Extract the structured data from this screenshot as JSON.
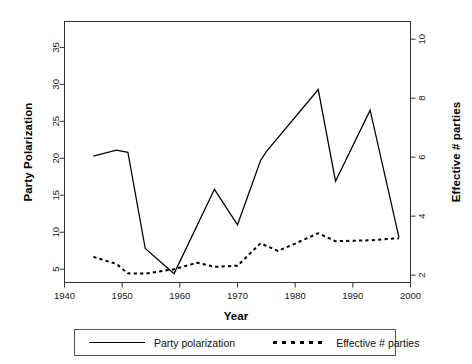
{
  "chart_data": {
    "type": "line",
    "title": "",
    "xlabel": "Year",
    "ylabel": "Party Polarization",
    "y2label": "Effective # parties",
    "xlim": [
      1940,
      2000
    ],
    "ylim": [
      3.2,
      38.5
    ],
    "y2lim": [
      1.75,
      10.6
    ],
    "grid": false,
    "legend_position": "bottom",
    "xticks": [
      1940,
      1950,
      1960,
      1970,
      1980,
      1990,
      2000
    ],
    "yticks": [
      5,
      10,
      15,
      20,
      25,
      30,
      35
    ],
    "y2ticks": [
      2,
      4,
      6,
      8,
      10
    ],
    "series": [
      {
        "name": "Party polarization",
        "axis": "left",
        "style": "solid",
        "color": "#000000",
        "x": [
          1945,
          1949,
          1951,
          1954,
          1959,
          1966,
          1970,
          1974,
          1975,
          1984,
          1987,
          1993,
          1998
        ],
        "values": [
          20.3,
          21.1,
          20.8,
          7.8,
          4.4,
          15.8,
          11.0,
          19.7,
          20.9,
          29.3,
          16.9,
          26.5,
          9.3
        ]
      },
      {
        "name": "Effective # parties",
        "axis": "right",
        "style": "dotted",
        "color": "#000000",
        "x": [
          1945,
          1949,
          1951,
          1954,
          1959,
          1963,
          1966,
          1970,
          1974,
          1977,
          1980,
          1984,
          1987,
          1993,
          1998
        ],
        "values": [
          2.62,
          2.38,
          2.06,
          2.05,
          2.2,
          2.42,
          2.28,
          2.32,
          3.08,
          2.82,
          3.07,
          3.42,
          3.15,
          3.18,
          3.25
        ]
      }
    ]
  },
  "axes": {
    "x_title": "Year",
    "y_left_title": "Party Polarization",
    "y_right_title": "Effective # parties"
  },
  "legend": {
    "entries": [
      {
        "label": "Party polarization",
        "key": "solid-line-key"
      },
      {
        "label": "Effective # parties",
        "key": "dotted-line-key"
      }
    ]
  }
}
